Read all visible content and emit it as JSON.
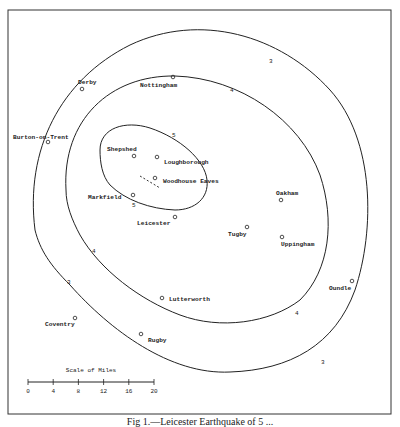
{
  "caption": "Fig 1.—Leicester Earthquake of 5 ...",
  "places": [
    {
      "name": "Nottingham",
      "x": 173,
      "y": 77,
      "lx": 140,
      "ly": 87
    },
    {
      "name": "Derby",
      "x": 82,
      "y": 89,
      "lx": 78,
      "ly": 84
    },
    {
      "name": "Burton-on-Trent",
      "x": 48,
      "y": 142,
      "lx": 13,
      "ly": 139
    },
    {
      "name": "Shepshed",
      "x": 134,
      "y": 156,
      "lx": 107,
      "ly": 151
    },
    {
      "name": "Loughborough",
      "x": 157,
      "y": 157,
      "lx": 164,
      "ly": 164
    },
    {
      "name": "Woodhouse Eaves",
      "x": 155,
      "y": 178,
      "lx": 163,
      "ly": 183
    },
    {
      "name": "Markfield",
      "x": 133,
      "y": 195,
      "lx": 88,
      "ly": 199
    },
    {
      "name": "Leicester",
      "x": 175,
      "y": 217,
      "lx": 137,
      "ly": 225
    },
    {
      "name": "Oakham",
      "x": 281,
      "y": 200,
      "lx": 276,
      "ly": 195
    },
    {
      "name": "Tugby",
      "x": 247,
      "y": 227,
      "lx": 228,
      "ly": 236
    },
    {
      "name": "Uppingham",
      "x": 282,
      "y": 237,
      "lx": 281,
      "ly": 246
    },
    {
      "name": "Oundle",
      "x": 352,
      "y": 281,
      "lx": 329,
      "ly": 290
    },
    {
      "name": "Lutterworth",
      "x": 162,
      "y": 298,
      "lx": 169,
      "ly": 301
    },
    {
      "name": "Coventry",
      "x": 75,
      "y": 318,
      "lx": 45,
      "ly": 326
    },
    {
      "name": "Rugby",
      "x": 141,
      "y": 334,
      "lx": 148,
      "ly": 342
    }
  ],
  "isoseismals": [
    {
      "label": "5",
      "positions": [
        [
          172,
          137
        ],
        [
          132,
          207
        ]
      ]
    },
    {
      "label": "4",
      "positions": [
        [
          230,
          92
        ],
        [
          92,
          253
        ],
        [
          295,
          315
        ]
      ]
    },
    {
      "label": "3",
      "positions": [
        [
          269,
          63
        ],
        [
          67,
          284
        ],
        [
          321,
          364
        ]
      ]
    }
  ],
  "scale": {
    "title": "Scale of Miles",
    "ticks": [
      "0",
      "4",
      "8",
      "12",
      "16",
      "20"
    ]
  }
}
